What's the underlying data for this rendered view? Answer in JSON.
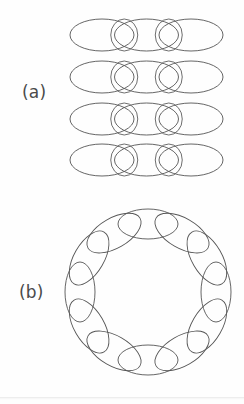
{
  "figure": {
    "caption_labels": [
      {
        "id": "a",
        "text": "(a)"
      },
      {
        "id": "b",
        "text": "(b)"
      }
    ],
    "stroke_color": "#555555",
    "narrow_stroke_color": "#5e5e5e",
    "background_color": "#fefefe",
    "stroke_width": 0.9,
    "canvas": {
      "width": 244,
      "height": 404
    }
  },
  "chart_data": {
    "type": "diagram",
    "title": "",
    "subtitle": "",
    "xlabel": "",
    "ylabel": "",
    "grid": false,
    "legend": null,
    "annotations": [
      "(a)",
      "(b)"
    ],
    "panels": [
      {
        "id": "a",
        "label": "(a)",
        "label_position": {
          "x": 22,
          "y": 93
        },
        "arrangement": "linear-chains",
        "row_count": 4,
        "row_centers_y": [
          35,
          77,
          119,
          160
        ],
        "row_span_x": [
          70,
          223
        ],
        "ellipses_per_row": 5,
        "pattern": [
          "wide",
          "narrow",
          "wide",
          "narrow",
          "wide"
        ],
        "wide_ellipse": {
          "rx": 32,
          "ry": 16,
          "rotation": 0
        },
        "narrow_ellipse": {
          "rx": 13.5,
          "ry": 16,
          "rotation": 0
        },
        "centers_x_wide": [
          102,
          146.5,
          191
        ],
        "centers_x_narrow": [
          124.25,
          168.75
        ]
      },
      {
        "id": "b",
        "label": "(b)",
        "label_position": {
          "x": 19,
          "y": 293
        },
        "arrangement": "closed-ring",
        "ring_center": {
          "x": 148,
          "y": 292
        },
        "ring_radius": 68,
        "ring_bounds_x": [
          68,
          228
        ],
        "ring_bounds_y": [
          206,
          378
        ],
        "ellipse_count": 12,
        "ellipse": {
          "rx": 30,
          "ry": 15
        },
        "angle_step_degrees": 30,
        "tangential_orientation": true
      }
    ]
  }
}
